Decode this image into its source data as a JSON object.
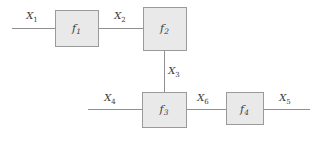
{
  "figure": {
    "name": "signal-flow-block-diagram",
    "type": "block-diagram",
    "background_color": "#ffffff",
    "width": 321,
    "height": 142
  },
  "style": {
    "block_fill": "#e9e9e9",
    "block_stroke": "#9a9a9a",
    "wire_color": "#8f8f8f",
    "text_color": "#3a3a3a"
  },
  "blocks": [
    {
      "id": "f1",
      "base": "f",
      "sub": "1",
      "x": 55,
      "y": 10,
      "w": 43,
      "h": 36,
      "cx": 76.5,
      "cy": 28
    },
    {
      "id": "f2",
      "base": "f",
      "sub": "2",
      "x": 143,
      "y": 7,
      "w": 43,
      "h": 43,
      "cx": 164.5,
      "cy": 28
    },
    {
      "id": "f3",
      "base": "f",
      "sub": "3",
      "x": 142,
      "y": 92,
      "w": 44,
      "h": 35,
      "cx": 164,
      "cy": 109
    },
    {
      "id": "f4",
      "base": "f",
      "sub": "4",
      "x": 226,
      "y": 92,
      "w": 37,
      "h": 32,
      "cx": 244.5,
      "cy": 109
    }
  ],
  "signals": [
    {
      "id": "x1",
      "base": "X",
      "sub": "1",
      "lx": 32,
      "ly": 19,
      "from": "input",
      "to": "f1"
    },
    {
      "id": "x2",
      "base": "X",
      "sub": "2",
      "lx": 120,
      "ly": 19,
      "from": "f1",
      "to": "f2"
    },
    {
      "id": "x3",
      "base": "X",
      "sub": "3",
      "lx": 174,
      "ly": 74,
      "from": "f2",
      "to": "f3"
    },
    {
      "id": "x4",
      "base": "X",
      "sub": "4",
      "lx": 110,
      "ly": 101,
      "from": "input",
      "to": "f3"
    },
    {
      "id": "x6",
      "base": "X",
      "sub": "6",
      "lx": 203,
      "ly": 101,
      "from": "f3",
      "to": "f4"
    },
    {
      "id": "x5",
      "base": "X",
      "sub": "5",
      "lx": 285,
      "ly": 101,
      "from": "f4",
      "to": "output"
    }
  ],
  "wires": [
    {
      "id": "wire-x1",
      "orientation": "horizontal",
      "x1": 12,
      "y1": 28,
      "x2": 55,
      "y2": 28
    },
    {
      "id": "wire-x2",
      "orientation": "horizontal",
      "x1": 98,
      "y1": 28,
      "x2": 143,
      "y2": 28
    },
    {
      "id": "wire-x3",
      "orientation": "vertical",
      "x1": 164,
      "y1": 50,
      "x2": 164,
      "y2": 92
    },
    {
      "id": "wire-x4",
      "orientation": "horizontal",
      "x1": 88,
      "y1": 109,
      "x2": 142,
      "y2": 109
    },
    {
      "id": "wire-x6",
      "orientation": "horizontal",
      "x1": 186,
      "y1": 109,
      "x2": 226,
      "y2": 109
    },
    {
      "id": "wire-x5",
      "orientation": "horizontal",
      "x1": 263,
      "y1": 109,
      "x2": 310,
      "y2": 109
    }
  ]
}
